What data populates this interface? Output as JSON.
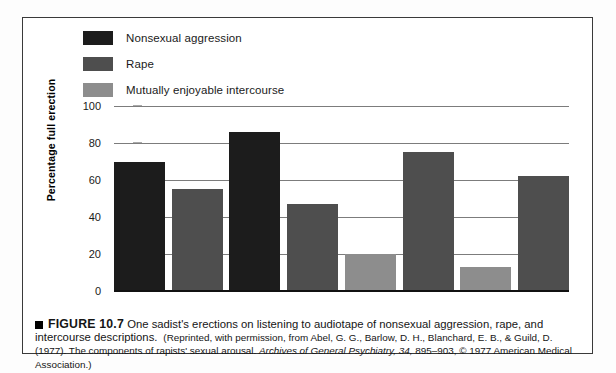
{
  "figure": {
    "bullet_icon": "black-square",
    "number_label": "FIGURE 10.7",
    "caption_main": "One sadist's erections on listening to audiotape of nonsexual aggression, rape, and intercourse descriptions.",
    "caption_source_part1": "(Reprinted, with permission, from Abel, G. G., Barlow, D. H., Blanchard, E. B., & Guild, D. (1977). The components of rapists' sexual arousal. ",
    "caption_source_italic": "Archives of General Psychiatry, 34,",
    "caption_source_part2": " 895–903, © 1977 American Medical Association.)"
  },
  "legend": {
    "items": [
      {
        "label": "Nonsexual aggression",
        "color": "#1c1c1c"
      },
      {
        "label": "Rape",
        "color": "#4e4e4e"
      },
      {
        "label": "Mutually enjoyable intercourse",
        "color": "#8d8d8d"
      }
    ]
  },
  "axis": {
    "ylabel": "Percentage full erection",
    "yticks": [
      "100",
      "80",
      "60",
      "40",
      "20",
      "0"
    ]
  },
  "chart_data": {
    "type": "bar",
    "title": "",
    "xlabel": "",
    "ylabel": "Percentage full erection",
    "ylim": [
      0,
      100
    ],
    "ytick_values": [
      0,
      20,
      40,
      60,
      80,
      100
    ],
    "grid": true,
    "legend_position": "top-left",
    "categories": [
      "1",
      "2",
      "3",
      "4",
      "5",
      "6",
      "7",
      "8"
    ],
    "bars": [
      {
        "index": 1,
        "series": "Nonsexual aggression",
        "value": 70,
        "color": "#1c1c1c"
      },
      {
        "index": 2,
        "series": "Rape",
        "value": 55,
        "color": "#4e4e4e"
      },
      {
        "index": 3,
        "series": "Nonsexual aggression",
        "value": 86,
        "color": "#1c1c1c"
      },
      {
        "index": 4,
        "series": "Rape",
        "value": 47,
        "color": "#4e4e4e"
      },
      {
        "index": 5,
        "series": "Mutually enjoyable intercourse",
        "value": 20,
        "color": "#8d8d8d"
      },
      {
        "index": 6,
        "series": "Rape",
        "value": 75,
        "color": "#4e4e4e"
      },
      {
        "index": 7,
        "series": "Mutually enjoyable intercourse",
        "value": 13,
        "color": "#8d8d8d"
      },
      {
        "index": 8,
        "series": "Rape",
        "value": 62,
        "color": "#4e4e4e"
      }
    ],
    "series": [
      {
        "name": "Nonsexual aggression",
        "color": "#1c1c1c",
        "values": [
          70,
          null,
          86,
          null,
          null,
          null,
          null,
          null
        ]
      },
      {
        "name": "Rape",
        "color": "#4e4e4e",
        "values": [
          null,
          55,
          null,
          47,
          null,
          75,
          null,
          62
        ]
      },
      {
        "name": "Mutually enjoyable intercourse",
        "color": "#8d8d8d",
        "values": [
          null,
          null,
          null,
          null,
          20,
          null,
          13,
          null
        ]
      }
    ]
  }
}
